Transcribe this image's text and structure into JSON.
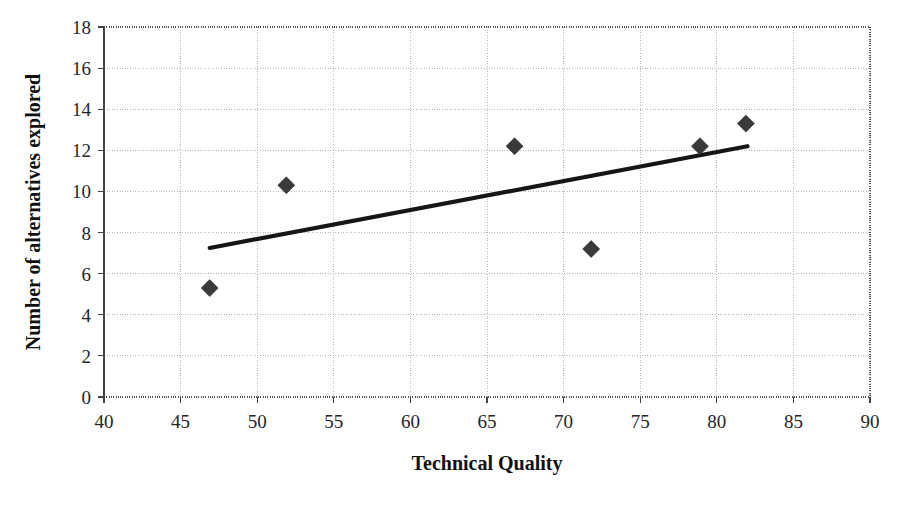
{
  "chart_data": {
    "type": "scatter",
    "title": "",
    "xlabel": "Technical Quality",
    "ylabel": "Number of alternatives explored",
    "xlim": [
      40,
      90
    ],
    "ylim": [
      0,
      18
    ],
    "xticks": [
      40,
      45,
      50,
      55,
      60,
      65,
      70,
      75,
      80,
      85,
      90
    ],
    "yticks": [
      0,
      2,
      4,
      6,
      8,
      10,
      12,
      14,
      16,
      18
    ],
    "grid": true,
    "legend": null,
    "marker": "diamond",
    "marker_color": "#3a3a3a",
    "points": [
      {
        "x": 46.9,
        "y": 5.3
      },
      {
        "x": 51.9,
        "y": 10.3
      },
      {
        "x": 66.8,
        "y": 12.2
      },
      {
        "x": 71.8,
        "y": 7.2
      },
      {
        "x": 78.9,
        "y": 12.2
      },
      {
        "x": 81.9,
        "y": 13.3
      }
    ],
    "trendline": {
      "type": "linear",
      "color": "#161616",
      "x_start": 46.9,
      "y_start": 7.25,
      "x_end": 82.0,
      "y_end": 12.2
    }
  },
  "axes": {
    "x_tick_labels": [
      "40",
      "45",
      "50",
      "55",
      "60",
      "65",
      "70",
      "75",
      "80",
      "85",
      "90"
    ],
    "y_tick_labels": [
      "0",
      "2",
      "4",
      "6",
      "8",
      "10",
      "12",
      "14",
      "16",
      "18"
    ],
    "x_axis_title": "Technical Quality",
    "y_axis_title": "Number of alternatives explored"
  }
}
